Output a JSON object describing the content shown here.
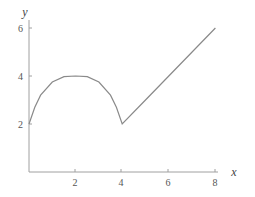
{
  "chart_data": {
    "type": "line",
    "title": "",
    "xlabel": "x",
    "ylabel": "y",
    "xlim": [
      0,
      8
    ],
    "ylim": [
      0,
      6
    ],
    "x_ticks": [
      "2",
      "4",
      "6",
      "8"
    ],
    "y_ticks": [
      "2",
      "4",
      "6"
    ],
    "grid": false,
    "legend": null,
    "series": [
      {
        "name": "f(x)",
        "x": [
          0,
          0.25,
          0.5,
          1,
          1.5,
          2,
          2.5,
          3,
          3.5,
          3.75,
          4,
          5,
          6,
          7,
          8
        ],
        "y": [
          2,
          2.7,
          3.2,
          3.75,
          3.97,
          4,
          3.97,
          3.75,
          3.2,
          2.7,
          2,
          3,
          4,
          5,
          6
        ]
      }
    ]
  },
  "colors": {
    "axis": "#999999",
    "line": "#8a8a8a",
    "text": "#555555"
  }
}
